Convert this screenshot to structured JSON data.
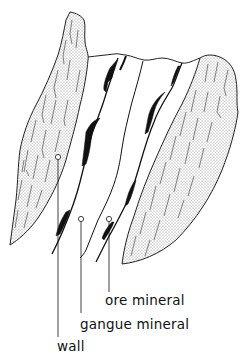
{
  "diagram": {
    "type": "geologic cross-section of a mineral vein",
    "labels": {
      "ore": "ore mineral",
      "gangue": "gangue mineral",
      "wall": "wall"
    },
    "colors": {
      "ink": "#111111",
      "background": "#ffffff",
      "wall_fill": "#d9d9d9"
    }
  }
}
